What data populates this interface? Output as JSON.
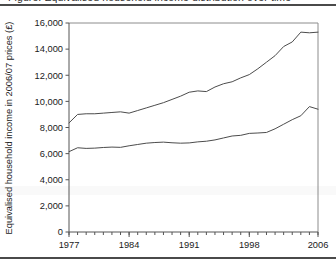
{
  "figure": {
    "clipped_title": "Figure: Equivalised household income distribution over time",
    "ylabel": "Equivalised household income in 2006/07 prices (£)"
  },
  "chart_data": {
    "type": "line",
    "title": "",
    "xlabel": "",
    "ylabel": "Equivalised household income in 2006/07 prices (£)",
    "xlim": [
      1977,
      2006
    ],
    "ylim": [
      0,
      16000
    ],
    "ytick_values": [
      0,
      2000,
      4000,
      6000,
      8000,
      10000,
      12000,
      14000,
      16000
    ],
    "ytick_labels": [
      "0",
      "2,000",
      "4,000",
      "6,000",
      "8,000",
      "10,000",
      "12,000",
      "14,000",
      "16,000"
    ],
    "xtick_values": [
      1977,
      1984,
      1991,
      1998,
      2006
    ],
    "xtick_labels": [
      "1977",
      "1984",
      "1991",
      "1998",
      "2006"
    ],
    "minor_xticks_every": 1,
    "grid": false,
    "legend": "none",
    "line_color": "#4c4c4c",
    "x": [
      1977,
      1978,
      1979,
      1980,
      1981,
      1982,
      1983,
      1984,
      1985,
      1986,
      1987,
      1988,
      1989,
      1990,
      1991,
      1992,
      1993,
      1994,
      1995,
      1996,
      1997,
      1998,
      1999,
      2000,
      2001,
      2002,
      2003,
      2004,
      2005,
      2006
    ],
    "series": [
      {
        "name": "Upper line",
        "values": [
          8350,
          9000,
          9050,
          9050,
          9100,
          9150,
          9200,
          9100,
          9300,
          9500,
          9700,
          9900,
          10150,
          10400,
          10700,
          10800,
          10750,
          11100,
          11350,
          11500,
          11800,
          12050,
          12500,
          13000,
          13500,
          14200,
          14550,
          15300,
          15250,
          15300
        ]
      },
      {
        "name": "Lower line",
        "values": [
          6150,
          6450,
          6400,
          6420,
          6470,
          6500,
          6480,
          6600,
          6700,
          6800,
          6850,
          6880,
          6830,
          6800,
          6820,
          6900,
          6950,
          7050,
          7200,
          7350,
          7400,
          7550,
          7580,
          7620,
          7900,
          8250,
          8600,
          8900,
          9600,
          9400
        ]
      }
    ]
  }
}
